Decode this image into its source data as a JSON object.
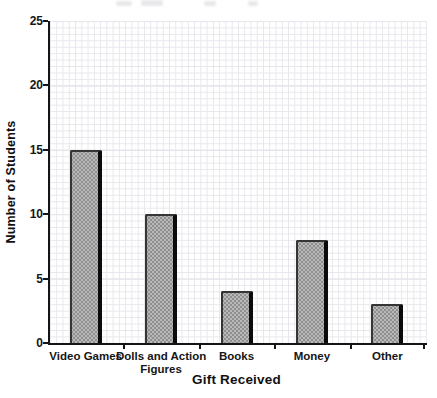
{
  "page": {
    "background": "#ffffff",
    "artifacts": {
      "top_edge_remnant": "illegible cropped-off text along top edge"
    }
  },
  "chart_data": {
    "type": "bar",
    "categories": [
      "Video Games",
      "Dolls and Action Figures",
      "Books",
      "Money",
      "Other"
    ],
    "values": [
      15,
      10,
      4,
      8,
      3
    ],
    "title": "",
    "xlabel": "Gift Received",
    "ylabel": "Number of Students",
    "ylim": [
      0,
      25
    ],
    "yticks": [
      0,
      5,
      10,
      15,
      20,
      25
    ],
    "grid": "fine graph paper, on",
    "legend": "none",
    "colors": {
      "bar_fill": "#b9b9b9",
      "bar_dot_texture": "#8f8f8f",
      "bar_border": "#353535",
      "bar_right_shadow": "#0b0b0b",
      "axis": "#151515",
      "grid_minor": "#e6e6ec",
      "grid_major": "#d7d7e0",
      "text": "#111111"
    }
  }
}
